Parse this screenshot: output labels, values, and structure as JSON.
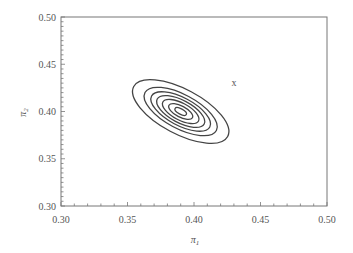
{
  "chart_data": {
    "type": "contour",
    "title": "",
    "xlabel": "π1",
    "ylabel": "π2",
    "xlim": [
      0.3,
      0.5
    ],
    "ylim": [
      0.3,
      0.5
    ],
    "xticks": [
      "0.30",
      "0.35",
      "0.40",
      "0.45",
      "0.50"
    ],
    "yticks": [
      "0.30",
      "0.35",
      "0.40",
      "0.45",
      "0.50"
    ],
    "grid": false,
    "legend": null,
    "contours": {
      "center": [
        0.39,
        0.4
      ],
      "levels": 7,
      "rotation_deg": -28,
      "semi_axes_outer": [
        0.04,
        0.016
      ],
      "scales": [
        1.0,
        0.76,
        0.62,
        0.5,
        0.38,
        0.25,
        0.12
      ]
    },
    "annotations": [
      {
        "text": "x",
        "x": 0.43,
        "y": 0.43
      }
    ]
  }
}
